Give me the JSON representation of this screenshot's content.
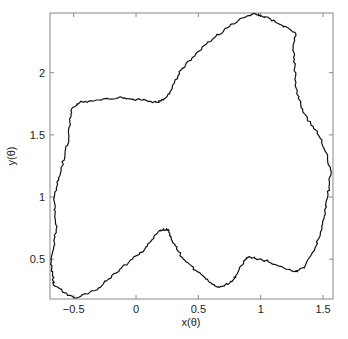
{
  "chart_data": {
    "type": "line",
    "title": "",
    "xlabel": "x(θ)",
    "ylabel": "y(θ)",
    "xlim": [
      -0.69,
      1.58
    ],
    "ylim": [
      0.18,
      2.48
    ],
    "grid": false,
    "legend": null,
    "x_ticks": [
      -0.5,
      0,
      0.5,
      1,
      1.5
    ],
    "x_tick_labels": [
      "−0.5",
      "0",
      "0.5",
      "1",
      "1.5"
    ],
    "y_ticks": [
      0.5,
      1,
      1.5,
      2
    ],
    "y_tick_labels": [
      "0.5",
      "1",
      "1.5",
      "2"
    ],
    "line_color": "#111111",
    "series": [
      {
        "name": "closed curve (x(θ), y(θ))",
        "closed": true,
        "x": [
          -0.49,
          -0.57,
          -0.66,
          -0.67,
          -0.68,
          -0.66,
          -0.64,
          -0.65,
          -0.66,
          -0.63,
          -0.6,
          -0.57,
          -0.54,
          -0.53,
          -0.51,
          -0.45,
          -0.38,
          -0.26,
          -0.14,
          -0.05,
          0.04,
          0.12,
          0.17,
          0.22,
          0.27,
          0.31,
          0.36,
          0.45,
          0.55,
          0.64,
          0.73,
          0.82,
          0.91,
          0.96,
          1.0,
          1.08,
          1.15,
          1.22,
          1.28,
          1.26,
          1.27,
          1.28,
          1.29,
          1.32,
          1.35,
          1.42,
          1.48,
          1.53,
          1.56,
          1.55,
          1.53,
          1.51,
          1.48,
          1.43,
          1.35,
          1.3,
          1.27,
          1.17,
          1.06,
          0.98,
          0.91,
          0.88,
          0.85,
          0.81,
          0.77,
          0.71,
          0.66,
          0.61,
          0.56,
          0.48,
          0.4,
          0.34,
          0.29,
          0.27,
          0.26,
          0.22,
          0.19,
          0.13,
          0.07,
          -0.03,
          -0.13,
          -0.22,
          -0.3,
          -0.4,
          -0.49
        ],
        "y": [
          0.19,
          0.23,
          0.29,
          0.38,
          0.48,
          0.6,
          0.74,
          0.86,
          0.98,
          1.1,
          1.22,
          1.34,
          1.46,
          1.6,
          1.72,
          1.76,
          1.77,
          1.79,
          1.8,
          1.79,
          1.78,
          1.77,
          1.76,
          1.78,
          1.83,
          1.93,
          2.02,
          2.12,
          2.22,
          2.29,
          2.36,
          2.42,
          2.46,
          2.47,
          2.46,
          2.43,
          2.39,
          2.36,
          2.32,
          2.22,
          2.11,
          1.97,
          1.83,
          1.75,
          1.67,
          1.57,
          1.47,
          1.35,
          1.22,
          1.1,
          0.98,
          0.85,
          0.72,
          0.57,
          0.43,
          0.41,
          0.4,
          0.44,
          0.48,
          0.5,
          0.52,
          0.5,
          0.45,
          0.38,
          0.32,
          0.29,
          0.28,
          0.3,
          0.34,
          0.41,
          0.48,
          0.56,
          0.65,
          0.7,
          0.74,
          0.74,
          0.73,
          0.66,
          0.58,
          0.5,
          0.42,
          0.34,
          0.27,
          0.22,
          0.19
        ]
      }
    ]
  }
}
